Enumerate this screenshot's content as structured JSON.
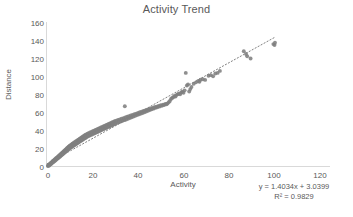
{
  "chart_data": {
    "type": "scatter",
    "title": "Activity Trend",
    "xlabel": "Activity",
    "ylabel": "Distance",
    "xlim": [
      0,
      120
    ],
    "ylim": [
      0,
      160
    ],
    "xticks": [
      0,
      20,
      40,
      60,
      80,
      100,
      120
    ],
    "yticks": [
      0,
      20,
      40,
      60,
      80,
      100,
      120,
      140,
      160
    ],
    "grid": false,
    "legend": "none",
    "marker_color": "#808080",
    "marker_shape": "circle",
    "trendline": {
      "type": "linear-dotted",
      "color": "#808080",
      "equation": "y = 1.4034x + 3.0399",
      "r_squared": "R² = 0.9829",
      "slope": 1.4034,
      "intercept": 3.0399,
      "x_start": 0,
      "x_end": 100.5
    },
    "series": [
      {
        "name": "Activity vs Distance",
        "points": [
          [
            0.4,
            0.6
          ],
          [
            0.6,
            1.2
          ],
          [
            0.8,
            0.9
          ],
          [
            1.0,
            2.1
          ],
          [
            1.1,
            1.5
          ],
          [
            1.3,
            3.0
          ],
          [
            1.4,
            2.4
          ],
          [
            1.6,
            3.6
          ],
          [
            1.7,
            2.8
          ],
          [
            1.9,
            4.2
          ],
          [
            2.0,
            3.4
          ],
          [
            2.2,
            5.0
          ],
          [
            2.3,
            4.1
          ],
          [
            2.5,
            5.8
          ],
          [
            2.6,
            4.6
          ],
          [
            2.8,
            6.4
          ],
          [
            2.9,
            5.2
          ],
          [
            3.1,
            7.0
          ],
          [
            3.2,
            5.9
          ],
          [
            3.4,
            7.8
          ],
          [
            3.5,
            6.5
          ],
          [
            3.7,
            8.4
          ],
          [
            3.8,
            7.1
          ],
          [
            4.0,
            9.2
          ],
          [
            4.1,
            7.8
          ],
          [
            4.3,
            9.8
          ],
          [
            4.4,
            8.5
          ],
          [
            4.6,
            10.4
          ],
          [
            4.7,
            9.0
          ],
          [
            4.9,
            11.2
          ],
          [
            5.0,
            9.6
          ],
          [
            5.2,
            11.8
          ],
          [
            5.3,
            10.3
          ],
          [
            5.5,
            12.6
          ],
          [
            5.6,
            10.9
          ],
          [
            5.8,
            13.2
          ],
          [
            5.9,
            11.6
          ],
          [
            6.1,
            14.0
          ],
          [
            6.2,
            12.2
          ],
          [
            6.4,
            14.6
          ],
          [
            6.5,
            12.9
          ],
          [
            6.7,
            15.4
          ],
          [
            6.8,
            13.5
          ],
          [
            7.0,
            16.0
          ],
          [
            7.1,
            14.2
          ],
          [
            7.3,
            16.8
          ],
          [
            7.4,
            14.8
          ],
          [
            7.6,
            17.4
          ],
          [
            7.7,
            15.5
          ],
          [
            7.9,
            18.2
          ],
          [
            8.0,
            16.1
          ],
          [
            8.2,
            18.8
          ],
          [
            8.3,
            16.8
          ],
          [
            8.5,
            19.6
          ],
          [
            8.6,
            17.4
          ],
          [
            8.8,
            20.2
          ],
          [
            8.9,
            18.1
          ],
          [
            9.1,
            21.0
          ],
          [
            9.2,
            18.7
          ],
          [
            9.4,
            21.6
          ],
          [
            9.5,
            19.4
          ],
          [
            9.7,
            22.4
          ],
          [
            9.8,
            20.0
          ],
          [
            10.0,
            23.0
          ],
          [
            10.2,
            20.7
          ],
          [
            10.4,
            23.8
          ],
          [
            10.6,
            21.4
          ],
          [
            10.8,
            24.4
          ],
          [
            11.0,
            22.0
          ],
          [
            11.2,
            25.2
          ],
          [
            11.4,
            22.7
          ],
          [
            11.6,
            25.8
          ],
          [
            11.8,
            23.4
          ],
          [
            12.0,
            26.6
          ],
          [
            12.2,
            24.0
          ],
          [
            12.4,
            27.2
          ],
          [
            12.6,
            24.7
          ],
          [
            12.8,
            28.0
          ],
          [
            13.0,
            25.4
          ],
          [
            13.2,
            28.6
          ],
          [
            13.4,
            26.0
          ],
          [
            13.6,
            29.4
          ],
          [
            13.8,
            26.7
          ],
          [
            14.0,
            30.0
          ],
          [
            14.2,
            27.4
          ],
          [
            14.4,
            30.8
          ],
          [
            14.6,
            28.0
          ],
          [
            14.8,
            31.4
          ],
          [
            15.0,
            28.7
          ],
          [
            15.2,
            32.2
          ],
          [
            15.4,
            29.4
          ],
          [
            15.6,
            32.8
          ],
          [
            15.8,
            30.0
          ],
          [
            16.0,
            33.6
          ],
          [
            16.2,
            30.7
          ],
          [
            16.4,
            34.2
          ],
          [
            16.6,
            31.4
          ],
          [
            16.8,
            35.0
          ],
          [
            17.0,
            32.0
          ],
          [
            17.2,
            35.6
          ],
          [
            17.5,
            32.8
          ],
          [
            17.8,
            36.4
          ],
          [
            18.0,
            33.5
          ],
          [
            18.3,
            37.0
          ],
          [
            18.6,
            34.2
          ],
          [
            18.9,
            37.8
          ],
          [
            19.2,
            34.9
          ],
          [
            19.5,
            38.4
          ],
          [
            19.8,
            35.6
          ],
          [
            20.1,
            39.2
          ],
          [
            20.4,
            36.3
          ],
          [
            20.7,
            39.8
          ],
          [
            21.0,
            37.0
          ],
          [
            21.3,
            40.6
          ],
          [
            21.6,
            37.7
          ],
          [
            21.9,
            41.2
          ],
          [
            22.2,
            38.4
          ],
          [
            22.5,
            42.0
          ],
          [
            22.8,
            39.1
          ],
          [
            23.1,
            42.6
          ],
          [
            23.4,
            39.8
          ],
          [
            23.7,
            43.4
          ],
          [
            24.0,
            40.5
          ],
          [
            24.3,
            44.0
          ],
          [
            24.6,
            41.2
          ],
          [
            24.9,
            44.8
          ],
          [
            25.2,
            41.9
          ],
          [
            25.5,
            45.4
          ],
          [
            25.8,
            42.6
          ],
          [
            26.1,
            46.2
          ],
          [
            26.4,
            43.3
          ],
          [
            26.7,
            46.8
          ],
          [
            27.0,
            44.0
          ],
          [
            27.3,
            47.6
          ],
          [
            27.6,
            44.7
          ],
          [
            27.9,
            48.2
          ],
          [
            28.2,
            45.4
          ],
          [
            28.5,
            49.0
          ],
          [
            28.8,
            46.1
          ],
          [
            29.1,
            49.6
          ],
          [
            29.4,
            46.8
          ],
          [
            29.7,
            50.4
          ],
          [
            30.0,
            47.5
          ],
          [
            30.4,
            51.0
          ],
          [
            30.8,
            48.3
          ],
          [
            31.2,
            51.8
          ],
          [
            31.6,
            49.1
          ],
          [
            32.0,
            52.4
          ],
          [
            32.4,
            49.9
          ],
          [
            32.8,
            53.2
          ],
          [
            33.2,
            50.7
          ],
          [
            33.6,
            53.8
          ],
          [
            34.0,
            51.5
          ],
          [
            34.2,
            67.0
          ],
          [
            34.4,
            54.6
          ],
          [
            34.8,
            52.3
          ],
          [
            35.2,
            55.2
          ],
          [
            35.6,
            53.1
          ],
          [
            36.0,
            56.0
          ],
          [
            36.4,
            53.9
          ],
          [
            36.8,
            56.6
          ],
          [
            37.2,
            54.7
          ],
          [
            37.6,
            57.4
          ],
          [
            38.0,
            55.5
          ],
          [
            38.4,
            58.0
          ],
          [
            38.8,
            56.3
          ],
          [
            39.2,
            58.8
          ],
          [
            39.6,
            57.1
          ],
          [
            40.0,
            59.4
          ],
          [
            40.4,
            57.9
          ],
          [
            40.8,
            60.2
          ],
          [
            41.2,
            58.7
          ],
          [
            41.6,
            60.8
          ],
          [
            42.0,
            59.5
          ],
          [
            42.4,
            61.6
          ],
          [
            42.8,
            60.3
          ],
          [
            43.2,
            62.2
          ],
          [
            43.6,
            61.1
          ],
          [
            44.0,
            63.0
          ],
          [
            44.4,
            61.9
          ],
          [
            44.8,
            63.6
          ],
          [
            45.2,
            62.7
          ],
          [
            45.6,
            64.4
          ],
          [
            46.0,
            63.5
          ],
          [
            46.4,
            65.0
          ],
          [
            46.8,
            64.3
          ],
          [
            47.2,
            65.8
          ],
          [
            47.6,
            65.1
          ],
          [
            48.0,
            66.4
          ],
          [
            48.5,
            65.9
          ],
          [
            49.0,
            67.2
          ],
          [
            49.5,
            66.7
          ],
          [
            50.0,
            68.0
          ],
          [
            50.5,
            67.5
          ],
          [
            51.0,
            68.6
          ],
          [
            51.5,
            68.3
          ],
          [
            52.0,
            69.4
          ],
          [
            52.5,
            69.1
          ],
          [
            53.0,
            70.0
          ],
          [
            53.5,
            71.5
          ],
          [
            54.0,
            72.8
          ],
          [
            54.5,
            75.0
          ],
          [
            55.0,
            76.2
          ],
          [
            55.5,
            77.0
          ],
          [
            56.0,
            78.4
          ],
          [
            56.5,
            77.8
          ],
          [
            57.0,
            79.6
          ],
          [
            57.5,
            80.4
          ],
          [
            58.0,
            81.0
          ],
          [
            58.5,
            80.2
          ],
          [
            59.0,
            82.4
          ],
          [
            59.5,
            83.0
          ],
          [
            60.0,
            82.0
          ],
          [
            60.5,
            84.6
          ],
          [
            61.0,
            104.0
          ],
          [
            61.5,
            90.0
          ],
          [
            62.0,
            91.2
          ],
          [
            62.5,
            83.4
          ],
          [
            63.0,
            86.0
          ],
          [
            63.5,
            88.4
          ],
          [
            64.5,
            92.0
          ],
          [
            65.5,
            93.5
          ],
          [
            66.5,
            95.0
          ],
          [
            67.0,
            94.2
          ],
          [
            67.5,
            96.4
          ],
          [
            68.5,
            97.0
          ],
          [
            69.5,
            96.2
          ],
          [
            71.0,
            100.8
          ],
          [
            72.0,
            101.5
          ],
          [
            73.0,
            100.2
          ],
          [
            74.0,
            103.4
          ],
          [
            75.0,
            104.0
          ],
          [
            76.0,
            106.2
          ],
          [
            86.5,
            128.0
          ],
          [
            87.5,
            125.0
          ],
          [
            88.0,
            122.5
          ],
          [
            89.5,
            120.0
          ],
          [
            99.5,
            136.0
          ],
          [
            100.0,
            135.0
          ],
          [
            100.2,
            137.5
          ]
        ]
      }
    ]
  },
  "axes": {
    "y_ticks": [
      "160",
      "140",
      "120",
      "100",
      "80",
      "60",
      "40",
      "20",
      "0"
    ],
    "x_ticks": [
      "0",
      "20",
      "40",
      "60",
      "80",
      "100",
      "120"
    ]
  },
  "annotations": {
    "equation": "y = 1.4034x + 3.0399",
    "r_squared": "R² = 0.9829"
  }
}
